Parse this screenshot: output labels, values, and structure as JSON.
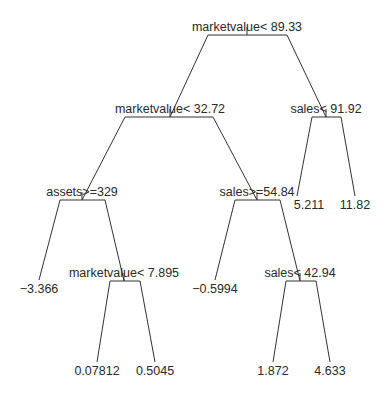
{
  "chart_data": {
    "type": "tree",
    "title": "",
    "nodes": [
      {
        "id": "n1",
        "label": "marketvalue< 89.33",
        "split_var": "marketvalue",
        "op": "<",
        "threshold": 89.33,
        "x": 247,
        "label_y": 31,
        "bar_y": 35,
        "bar_x1": 208,
        "bar_x2": 287,
        "left": "n2",
        "right": "n3"
      },
      {
        "id": "n2",
        "label": "marketvalue< 32.72",
        "split_var": "marketvalue",
        "op": "<",
        "threshold": 32.72,
        "x": 170,
        "label_y": 113,
        "bar_y": 117,
        "bar_x1": 125,
        "bar_x2": 213,
        "left": "n4",
        "right": "n5"
      },
      {
        "id": "n3",
        "label": "sales< 91.92",
        "split_var": "sales",
        "op": "<",
        "threshold": 91.92,
        "x": 326,
        "label_y": 113,
        "bar_y": 117,
        "bar_x1": 312,
        "bar_x2": 341,
        "left": "l7",
        "right": "l8"
      },
      {
        "id": "n4",
        "label": "assets>=329",
        "split_var": "assets",
        "op": ">=",
        "threshold": 329,
        "x": 82,
        "label_y": 196,
        "bar_y": 200,
        "bar_x1": 60,
        "bar_x2": 105,
        "left": "l1",
        "right": "n6"
      },
      {
        "id": "n5",
        "label": "sales>=54.84",
        "split_var": "sales",
        "op": ">=",
        "threshold": 54.84,
        "x": 257,
        "label_y": 196,
        "bar_y": 200,
        "bar_x1": 235,
        "bar_x2": 280,
        "left": "l4",
        "right": "n7"
      },
      {
        "id": "n6",
        "label": "marketvalue< 7.895",
        "split_var": "marketvalue",
        "op": "<",
        "threshold": 7.895,
        "x": 124,
        "label_y": 277,
        "bar_y": 281,
        "bar_x1": 110,
        "bar_x2": 140,
        "left": "l2",
        "right": "l3"
      },
      {
        "id": "n7",
        "label": "sales< 42.94",
        "split_var": "sales",
        "op": "<",
        "threshold": 42.94,
        "x": 300,
        "label_y": 277,
        "bar_y": 281,
        "bar_x1": 286,
        "bar_x2": 316,
        "left": "l5",
        "right": "l6"
      }
    ],
    "leaves": [
      {
        "id": "l1",
        "label": "−3.366",
        "value": -3.366,
        "x": 39,
        "tip_y": 280,
        "label_y": 293
      },
      {
        "id": "l2",
        "label": "0.07812",
        "value": 0.07812,
        "x": 97,
        "tip_y": 362,
        "label_y": 375
      },
      {
        "id": "l3",
        "label": "0.5045",
        "value": 0.5045,
        "x": 155,
        "tip_y": 362,
        "label_y": 375
      },
      {
        "id": "l4",
        "label": "−0.5994",
        "value": -0.5994,
        "x": 215,
        "tip_y": 280,
        "label_y": 293
      },
      {
        "id": "l5",
        "label": "1.872",
        "value": 1.872,
        "x": 273,
        "tip_y": 362,
        "label_y": 375
      },
      {
        "id": "l6",
        "label": "4.633",
        "value": 4.633,
        "x": 330,
        "tip_y": 362,
        "label_y": 375
      },
      {
        "id": "l7",
        "label": "5.211",
        "value": 5.211,
        "x": 297,
        "tip_y": 196,
        "label_y": 209,
        "label_dx": 12
      },
      {
        "id": "l8",
        "label": "11.82",
        "value": 11.82,
        "x": 355,
        "tip_y": 196,
        "label_y": 209
      }
    ]
  },
  "colors": {
    "line": "#333333",
    "text": "#2a2a2a",
    "background": "#ffffff"
  }
}
